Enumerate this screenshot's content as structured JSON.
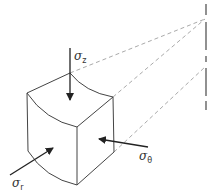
{
  "diagram": {
    "labels": {
      "sigma_z": {
        "symbol": "σ",
        "subscript": "z"
      },
      "sigma_theta": {
        "symbol": "σ",
        "subscript": "θ"
      },
      "sigma_r": {
        "symbol": "σ",
        "subscript": "r"
      }
    },
    "elements": [
      "curved stress element (cube-like, curved faces)",
      "axis of symmetry (dash-dot vertical line)",
      "dashed construction lines from element to axis",
      "arrow sigma_z downward on top face",
      "arrow sigma_theta on right face",
      "arrow sigma_r on left face"
    ],
    "colors": {
      "line": "#333333",
      "dashed": "#aaaaaa",
      "background": "#ffffff"
    }
  }
}
